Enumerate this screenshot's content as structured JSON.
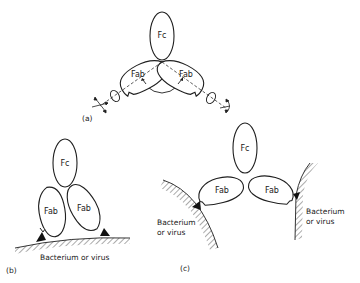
{
  "figure": {
    "panels": [
      {
        "id": "a",
        "label": "(a)",
        "domains": {
          "fc": "Fc",
          "fab_left": "Fab",
          "fab_right": "Fab"
        },
        "description": "Flexible Y-shaped antibody with hinge and elbow motions shown by arrows"
      },
      {
        "id": "b",
        "label": "(b)",
        "domains": {
          "fc": "Fc",
          "fab_left": "Fab",
          "fab_right": "Fab"
        },
        "surface_label": "Bacterium or virus"
      },
      {
        "id": "c",
        "label": "(c)",
        "domains": {
          "fc": "Fc",
          "fab_left": "Fab",
          "fab_right": "Fab"
        },
        "surface_left_label": [
          "Bacterium",
          "or virus"
        ],
        "surface_right_label": [
          "Bacterium",
          "or virus"
        ]
      }
    ],
    "colors": {
      "line": "#1f1f1f",
      "background": "#ffffff",
      "antigen": "#111111"
    }
  }
}
